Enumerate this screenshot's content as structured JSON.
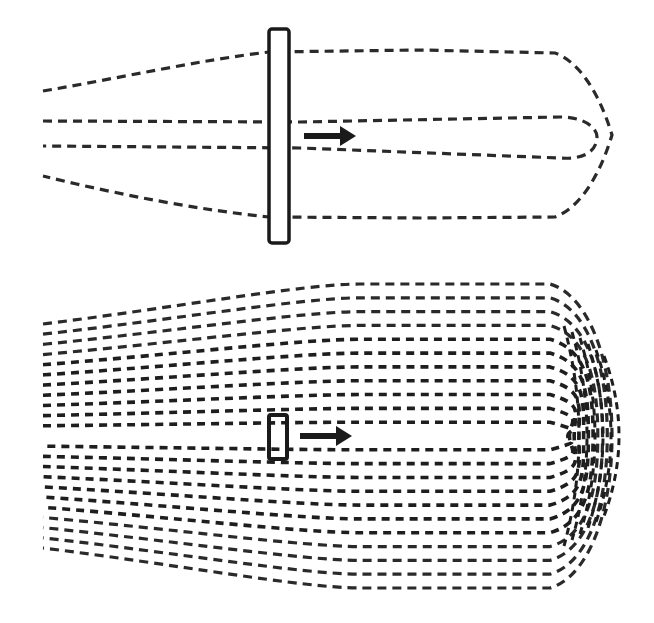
{
  "diagram": {
    "colors": {
      "background": "#ffffff",
      "ink": "#1e1e1e"
    },
    "top_panel": {
      "description": "Flow streamlines around a large plate moving right",
      "plate": {
        "x": 269,
        "y": 29,
        "width": 20,
        "height": 214,
        "rx": 3
      },
      "arrow": {
        "x1": 304,
        "x2": 356,
        "y": 136,
        "direction": "right-arrow-icon"
      },
      "streamlines": [
        {
          "name": "outer-loop",
          "d": "M43,91 C120,78 200,60 269,52 L420,50 L555,53 C580,62 600,95 612,135 C600,175 580,208 555,217 L420,218 L269,217 C200,210 120,195 43,176"
        },
        {
          "name": "inner-loop",
          "d": "M43,121 L300,122 L560,117 C585,117 597,128 597,137 C597,150 585,160 560,158 L300,148 L43,146"
        }
      ]
    },
    "bottom_panel": {
      "description": "Dense streamlines around a small plate moving right",
      "plate": {
        "x": 269,
        "y": 415,
        "width": 18,
        "height": 44,
        "rx": 2
      },
      "arrow": {
        "x1": 300,
        "x2": 352,
        "y": 436,
        "direction": "right-arrow-icon"
      },
      "field": {
        "left_x": 43,
        "knee_x": 560,
        "tip_x": 612,
        "center_y": 436,
        "line_count": 22,
        "left_half_span": 112,
        "right_half_span": 152
      }
    }
  }
}
